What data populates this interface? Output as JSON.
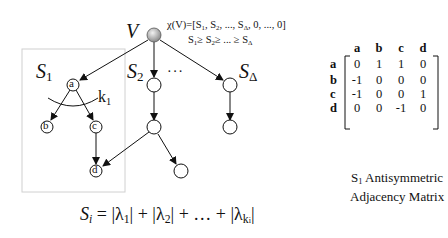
{
  "diagram": {
    "root": {
      "label": "V"
    },
    "chi_formula": "χ(V)=[S₁, S₂, ..., S_Δ, 0, ..., 0]",
    "chi_parts": {
      "prefix": "χ(V)=[S",
      "s1_sub": "1",
      "mid1": ", S",
      "s2_sub": "2",
      "mid2": ", ..., S",
      "sd_sub": "Δ",
      "suffix": ", 0, ..., 0]"
    },
    "order_parts": {
      "s": "S",
      "s1_sub": "1",
      "ge1": "≥ S",
      "s2_sub": "2",
      "ge2": "≥ ... ≥ S",
      "sd_sub": "Δ"
    },
    "subtrees": [
      {
        "label": "S",
        "sub": "1"
      },
      {
        "label": "S",
        "sub": "2"
      },
      {
        "label": "S",
        "sub": "Δ"
      }
    ],
    "ellipsis": "···",
    "k_label": {
      "text": "k",
      "sub": "1"
    },
    "nodes": {
      "a": "a",
      "b": "b",
      "c": "c",
      "d": "d"
    },
    "colors": {
      "root_fill": "#9a9a9a",
      "edge": "#111111",
      "box": "#d0d0d0"
    }
  },
  "matrix": {
    "col_headers": [
      "a",
      "b",
      "c",
      "d"
    ],
    "rows": [
      {
        "header": "a",
        "values": [
          "0",
          "1",
          "1",
          "0"
        ]
      },
      {
        "header": "b",
        "values": [
          "-1",
          "0",
          "0",
          "0"
        ]
      },
      {
        "header": "c",
        "values": [
          "-1",
          "0",
          "0",
          "1"
        ]
      },
      {
        "header": "d",
        "values": [
          "0",
          "0",
          "-1",
          "0"
        ]
      }
    ],
    "caption_line1_prefix": "S",
    "caption_line1_sub": "1",
    "caption_line1_rest": " Antisymmetric",
    "caption_line2": "Adjacency Matrix"
  },
  "formula": {
    "lhs": "S",
    "lhs_sub": "i",
    "eq": " = ",
    "lambda": "λ",
    "sub1": "1",
    "sub2": "2",
    "subk": "k",
    "subk_sub": "i",
    "plus": " + ",
    "dots": " + … + ",
    "text": "S_i = |λ₁| + |λ₂| + … + |λ_{k_i}|"
  }
}
